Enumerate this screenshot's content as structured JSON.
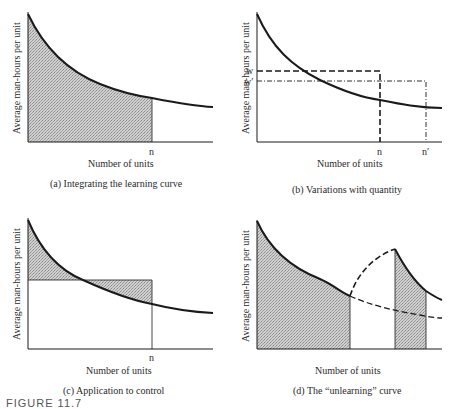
{
  "figure": {
    "partial_caption": "FIGURE 11.7",
    "panels": [
      {
        "id": "a",
        "caption": "(a)  Integrating the learning curve",
        "ylabel": "Average man-hours per unit",
        "xlabel": "Number of units",
        "x_ticks": [
          "n"
        ],
        "description": "Learning curve with area under curve shaded from 0 to n"
      },
      {
        "id": "b",
        "caption": "(b)  Variations with quantity",
        "ylabel": "Average man-hours per unit",
        "xlabel": "Number of units",
        "x_ticks": [
          "n",
          "n′"
        ],
        "y_ticks": [
          "w",
          "w′"
        ],
        "description": "Learning curve with dashed rectangle to (n, w) and dash-dot rectangle to (n', w')"
      },
      {
        "id": "c",
        "caption": "(c)  Application to control",
        "ylabel": "Average man-hours per unit",
        "xlabel": "Number of units",
        "x_ticks": [
          "n"
        ],
        "description": "Rectangle of constant average up to n; shaded regions between rectangle top and curve"
      },
      {
        "id": "d",
        "caption": "(d)  The “unlearning” curve",
        "ylabel": "Average man-hours per unit",
        "xlabel": "Number of units",
        "x_ticks": [],
        "description": "Learning curve interrupted; dashed unlearning rise then resumed learning curve; dashed continuation of original curve"
      }
    ]
  },
  "colors": {
    "line": "#1a1a1a",
    "shade": "#bdbdbd",
    "background": "#ffffff"
  }
}
